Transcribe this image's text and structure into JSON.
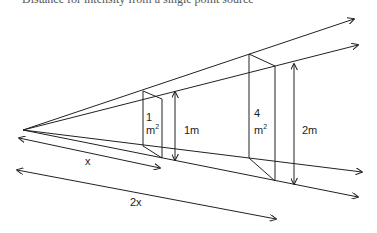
{
  "caption_fragment": "Distance for intensity from a single point source",
  "diagram": {
    "small_area_label": {
      "number": "1",
      "unit": "m",
      "exponent": "2"
    },
    "small_height_label": "1m",
    "large_area_label": {
      "number": "4",
      "unit": "m",
      "exponent": "2"
    },
    "large_height_label": "2m",
    "distance_short_label": "x",
    "distance_long_label": "2x",
    "stroke_color": "#222222"
  }
}
